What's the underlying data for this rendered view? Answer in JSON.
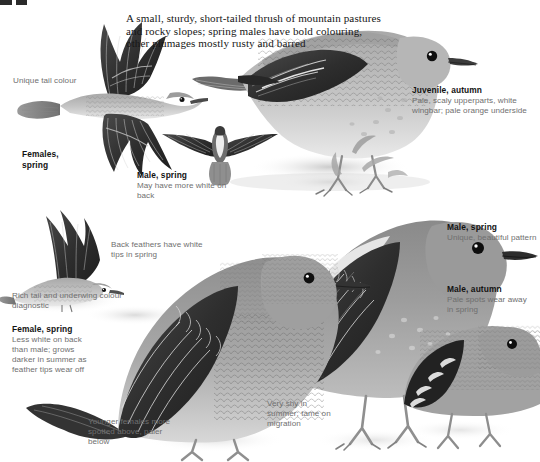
{
  "plate": {
    "intro_text": "A small, sturdy, short-tailed thrush of mountain pastures and rocky slopes; spring males have bold colouring, other plumages mostly rusty and barred"
  },
  "captions": {
    "unique_tail": {
      "heading": "",
      "body": "Unique tail colour"
    },
    "females_spring": {
      "heading": "Females, spring",
      "body": ""
    },
    "juvenile_autumn": {
      "heading": "Juvenile, autumn",
      "body": "Pale, scaly upperparts, white wingbar; pale orange underside"
    },
    "male_spring_flight": {
      "heading": "Male, spring",
      "body": "May have more white on back"
    },
    "back_feathers": {
      "heading": "",
      "body": "Back feathers have white tips in spring"
    },
    "rich_tail": {
      "heading": "",
      "body": "Rich tail and underwing colour diagnostic"
    },
    "female_spring": {
      "heading": "Female, spring",
      "body": "Less white on back than male; grows darker in summer as feather tips wear off"
    },
    "younger_females": {
      "heading": "",
      "body": "Younger females more spotted above, paler below"
    },
    "very_shy": {
      "heading": "",
      "body": "Very shy in summer; tame on migration"
    },
    "male_spring_perched": {
      "heading": "Male, spring",
      "body": "Unique, beautiful pattern"
    },
    "male_autumn": {
      "heading": "Male, autumn",
      "body": "Pale spots wear away in spring"
    }
  },
  "figures": {
    "female_flight_upper": "female-in-flight-upperside",
    "male_flight_below": "male-in-flight-underside",
    "female_landing": "female-landing-wings-raised",
    "juvenile_perched": "juvenile-autumn-perched",
    "female_perched": "female-spring-perched",
    "male_perched": "male-spring-perched",
    "male_autumn_perched": "male-autumn-perched"
  },
  "colors": {
    "ink": "#161616",
    "caption_text": "#6f6f6f",
    "heading_text": "#131313",
    "plumage_dark": "#3a3a3a",
    "plumage_mid": "#8d8d8d",
    "plumage_light": "#c9c9c9",
    "background": "#ffffff"
  }
}
